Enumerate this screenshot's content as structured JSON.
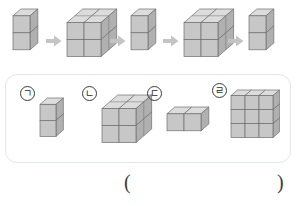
{
  "page": {
    "header_fragment": "",
    "background": "#ffffff"
  },
  "palette": {
    "cube_front": "#c7c7c7",
    "cube_top": "#dcdcdc",
    "cube_side": "#b0b0b0",
    "cube_edge": "#6e6e6e",
    "arrow": "#c4c4c4",
    "panel_border": "#e3e5e8",
    "label_text": "#1f1f1f",
    "paren_text": "#3b3b3b"
  },
  "sequence": {
    "name": "pattern-sequence",
    "arrow_glyph": "right-arrow",
    "figures": [
      {
        "id": "seq-1",
        "shape": "vertical-stack",
        "cols": 1,
        "rows": 2,
        "depth": 1,
        "cube_count": 2
      },
      {
        "id": "seq-2",
        "shape": "cube-2x2x2",
        "cols": 2,
        "rows": 2,
        "depth": 2,
        "cube_count": 8
      },
      {
        "id": "seq-3",
        "shape": "vertical-stack",
        "cols": 1,
        "rows": 2,
        "depth": 1,
        "cube_count": 2
      },
      {
        "id": "seq-4",
        "shape": "cube-2x2x2",
        "cols": 2,
        "rows": 2,
        "depth": 2,
        "cube_count": 8
      },
      {
        "id": "seq-5",
        "shape": "vertical-stack",
        "cols": 1,
        "rows": 2,
        "depth": 1,
        "cube_count": 2
      }
    ]
  },
  "options": {
    "name": "answer-choices",
    "items": [
      {
        "label": "ㄱ",
        "shape": "vertical-stack",
        "cols": 1,
        "rows": 2,
        "depth": 1,
        "cube_count": 2
      },
      {
        "label": "ㄴ",
        "shape": "cube-2x2x2",
        "cols": 2,
        "rows": 2,
        "depth": 2,
        "cube_count": 8
      },
      {
        "label": "ㄷ",
        "shape": "horizontal-pair",
        "cols": 2,
        "rows": 1,
        "depth": 1,
        "cube_count": 2
      },
      {
        "label": "ㄹ",
        "shape": "wall-3x3",
        "cols": 3,
        "rows": 3,
        "depth": 1,
        "cube_count": 9
      }
    ]
  },
  "answer": {
    "name": "answer-blank",
    "left_paren": "(",
    "right_paren": ")",
    "value": ""
  }
}
